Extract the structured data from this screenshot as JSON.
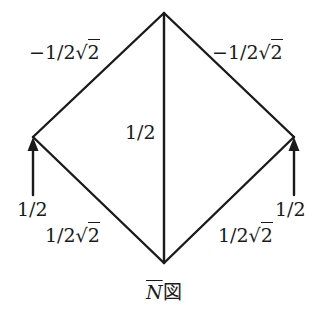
{
  "diagram": {
    "title_symbol": "N",
    "title_suffix": "図",
    "nodes": {
      "top": [
        164,
        13
      ],
      "left": [
        33,
        137
      ],
      "right": [
        294,
        137
      ],
      "bottom": [
        164,
        263
      ]
    },
    "members": [
      {
        "id": "top-left",
        "from": "top",
        "to": "left",
        "value": "−1/2√2",
        "coef": "−1/2",
        "root": "2"
      },
      {
        "id": "top-right",
        "from": "top",
        "to": "right",
        "value": "−1/2√2",
        "coef": "−1/2",
        "root": "2"
      },
      {
        "id": "vertical",
        "from": "top",
        "to": "bottom",
        "value": "1/2"
      },
      {
        "id": "left-bottom",
        "from": "left",
        "to": "bottom",
        "value": "1/2√2",
        "coef": "1/2",
        "root": "2"
      },
      {
        "id": "right-bottom",
        "from": "right",
        "to": "bottom",
        "value": "1/2√2",
        "coef": "1/2",
        "root": "2"
      }
    ],
    "loads": [
      {
        "id": "left-load",
        "at": "left",
        "direction": "up",
        "value": "1/2"
      },
      {
        "id": "right-load",
        "at": "right",
        "direction": "up",
        "value": "1/2"
      }
    ],
    "stroke_color": "#1a1a1a",
    "background": "#ffffff"
  }
}
